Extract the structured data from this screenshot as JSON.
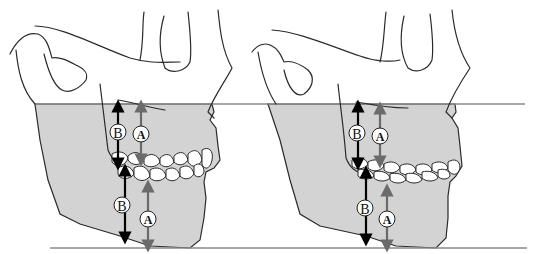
{
  "figure": {
    "panels": [
      {
        "id": "left",
        "description": "Lateral skull with normal occlusion; vertical measurements B (black) and A (gray) above and below occlusal plane",
        "labels": {
          "upper_b": "B",
          "upper_a": "A",
          "lower_b": "B",
          "lower_a": "A"
        }
      },
      {
        "id": "right",
        "description": "Lateral skull with flattened/attrited dentition; vertical measurements B (black) and A (gray) above and below occlusal plane",
        "labels": {
          "upper_b": "B",
          "upper_a": "A",
          "lower_b": "B",
          "lower_a": "A"
        }
      }
    ],
    "colors": {
      "shading": "#d3d3d3",
      "outline": "#2a2a2a",
      "arrow_b": "#000000",
      "arrow_a": "#6b6b6b",
      "reference_line": "#8a8a8a"
    }
  }
}
